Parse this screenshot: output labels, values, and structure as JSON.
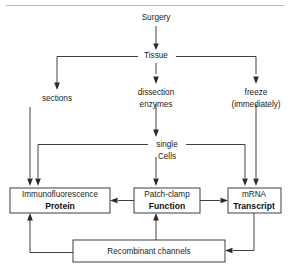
{
  "figure": {
    "top_rule": true,
    "background_color": "#ffffff",
    "line_color": "#2a2a2a"
  },
  "nodes": {
    "surgery": {
      "label": "Surgery",
      "type": "plain",
      "x": 156,
      "y": 18
    },
    "tissue": {
      "label": "Tissue",
      "type": "plain",
      "x": 156,
      "y": 56
    },
    "sections": {
      "label": "sections",
      "type": "plain",
      "x": 57,
      "y": 99
    },
    "dissection": {
      "line1": "dissection",
      "line2": "enzymes",
      "type": "plain",
      "x": 156,
      "y": 93
    },
    "freeze": {
      "line1": "freeze",
      "line2": "(immediately)",
      "type": "plain",
      "x": 256,
      "y": 93
    },
    "single_cells": {
      "line1": "single",
      "line2": "Cells",
      "type": "plain",
      "x": 167,
      "y": 146
    },
    "protein": {
      "line1": "Immunofluorescence",
      "line2": "Protein",
      "type": "box",
      "x": 10,
      "y": 188,
      "w": 100,
      "h": 25
    },
    "function": {
      "line1": "Patch-clamp",
      "line2": "Function",
      "type": "box",
      "x": 134,
      "y": 188,
      "w": 66,
      "h": 25
    },
    "transcript": {
      "line1": "mRNA",
      "line2": "Transcript",
      "type": "box",
      "x": 228,
      "y": 188,
      "w": 53,
      "h": 25
    },
    "recombinant": {
      "label": "Recombinant channels",
      "type": "box",
      "x": 73,
      "y": 240,
      "w": 152,
      "h": 22
    }
  },
  "edges": [
    {
      "name": "surgery-to-tissue",
      "from": "surgery",
      "to": "tissue",
      "arrow": "down"
    },
    {
      "name": "tissue-to-sections",
      "from": "tissue",
      "to": "sections",
      "arrow": "down"
    },
    {
      "name": "tissue-to-dissection",
      "from": "tissue",
      "to": "dissection",
      "arrow": "down"
    },
    {
      "name": "tissue-to-freeze",
      "from": "tissue",
      "to": "freeze",
      "arrow": "down"
    },
    {
      "name": "dissection-to-single-cells",
      "from": "dissection",
      "to": "single_cells",
      "arrow": "down"
    },
    {
      "name": "sections-to-protein",
      "from": "sections",
      "to": "protein",
      "arrow": "down"
    },
    {
      "name": "single-cells-to-protein",
      "from": "single_cells",
      "to": "protein",
      "arrow": "down"
    },
    {
      "name": "single-cells-to-function",
      "from": "single_cells",
      "to": "function",
      "arrow": "down"
    },
    {
      "name": "single-cells-to-transcript",
      "from": "single_cells",
      "to": "transcript",
      "arrow": "down"
    },
    {
      "name": "freeze-to-transcript",
      "from": "freeze",
      "to": "transcript",
      "arrow": "down"
    },
    {
      "name": "function-to-protein",
      "from": "function",
      "to": "protein",
      "arrow": "left"
    },
    {
      "name": "function-to-transcript",
      "from": "function",
      "to": "transcript",
      "arrow": "right"
    },
    {
      "name": "transcript-to-recombinant",
      "from": "transcript",
      "to": "recombinant",
      "arrow": "left"
    },
    {
      "name": "recombinant-to-protein",
      "from": "recombinant",
      "to": "protein",
      "arrow": "up"
    },
    {
      "name": "recombinant-to-function",
      "from": "recombinant",
      "to": "function",
      "arrow": "up"
    }
  ]
}
